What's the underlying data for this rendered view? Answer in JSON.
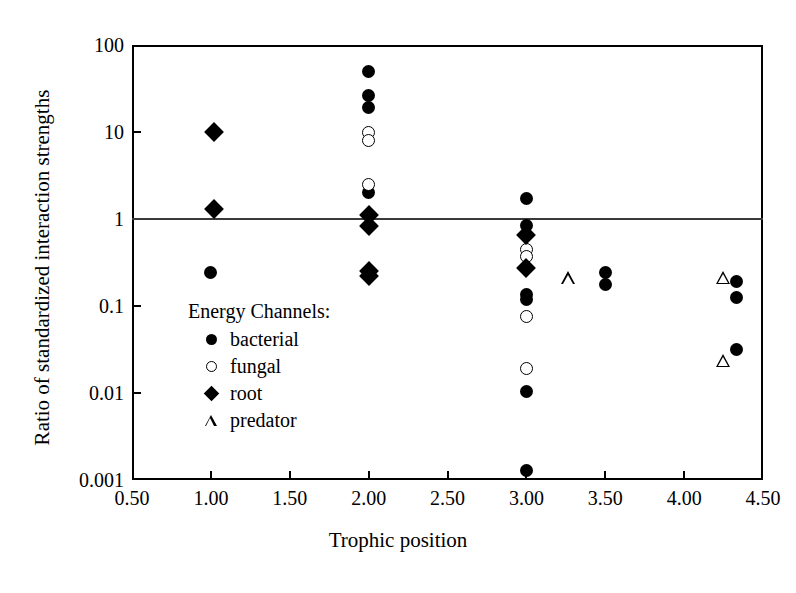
{
  "chart_data": {
    "type": "scatter",
    "title": "",
    "xlabel": "Trophic position",
    "ylabel": "Ratio of standardized interaction strengths",
    "xlim": [
      0.5,
      4.5
    ],
    "ylim": [
      0.001,
      100
    ],
    "yscale": "log",
    "xticks": [
      "0.50",
      "1.00",
      "1.50",
      "2.00",
      "2.50",
      "3.00",
      "3.50",
      "4.00",
      "4.50"
    ],
    "xtick_values": [
      0.5,
      1.0,
      1.5,
      2.0,
      2.5,
      3.0,
      3.5,
      4.0,
      4.5
    ],
    "yticks": [
      "100",
      "10",
      "1",
      "0.1",
      "0.01",
      "0.001"
    ],
    "ytick_values": [
      100,
      10,
      1,
      0.1,
      0.01,
      0.001
    ],
    "grid": false,
    "reference_line": {
      "y": 1,
      "orientation": "horizontal",
      "color": "#3a3a3a"
    },
    "legend_title": "Energy Channels:",
    "legend_position": "inside-left",
    "series": [
      {
        "name": "bacterial",
        "marker": "filled-circle",
        "color": "#000000",
        "points": [
          {
            "x": 1.0,
            "y": 0.24
          },
          {
            "x": 2.0,
            "y": 50
          },
          {
            "x": 2.0,
            "y": 26
          },
          {
            "x": 2.0,
            "y": 19
          },
          {
            "x": 2.0,
            "y": 2.0
          },
          {
            "x": 3.0,
            "y": 1.7
          },
          {
            "x": 3.0,
            "y": 0.85
          },
          {
            "x": 3.0,
            "y": 0.135
          },
          {
            "x": 3.0,
            "y": 0.12
          },
          {
            "x": 3.0,
            "y": 0.0105
          },
          {
            "x": 3.0,
            "y": 0.0013
          },
          {
            "x": 3.5,
            "y": 0.245
          },
          {
            "x": 3.5,
            "y": 0.175
          },
          {
            "x": 4.33,
            "y": 0.19
          },
          {
            "x": 4.33,
            "y": 0.125
          },
          {
            "x": 4.33,
            "y": 0.032
          }
        ]
      },
      {
        "name": "fungal",
        "marker": "open-circle",
        "color": "#000000",
        "points": [
          {
            "x": 2.0,
            "y": 10.0
          },
          {
            "x": 2.0,
            "y": 8.0
          },
          {
            "x": 2.0,
            "y": 2.5
          },
          {
            "x": 3.0,
            "y": 0.45
          },
          {
            "x": 3.0,
            "y": 0.37
          },
          {
            "x": 3.0,
            "y": 0.075
          },
          {
            "x": 3.0,
            "y": 0.019
          }
        ]
      },
      {
        "name": "root",
        "marker": "filled-diamond",
        "color": "#000000",
        "points": [
          {
            "x": 1.02,
            "y": 10.0
          },
          {
            "x": 1.02,
            "y": 1.3
          },
          {
            "x": 2.0,
            "y": 1.1
          },
          {
            "x": 2.0,
            "y": 0.82
          },
          {
            "x": 2.0,
            "y": 0.25
          },
          {
            "x": 2.0,
            "y": 0.22
          },
          {
            "x": 3.0,
            "y": 0.65
          },
          {
            "x": 3.0,
            "y": 0.27
          }
        ]
      },
      {
        "name": "predator",
        "marker": "open-triangle",
        "color": "#000000",
        "points": [
          {
            "x": 3.27,
            "y": 0.21
          },
          {
            "x": 4.25,
            "y": 0.3
          },
          {
            "x": 4.25,
            "y": 0.047
          }
        ]
      }
    ]
  },
  "axes": {
    "x_title": "Trophic position",
    "y_title": "Ratio of standardized interaction strengths"
  },
  "legend": {
    "title": "Energy Channels:",
    "items": [
      {
        "label": "bacterial",
        "symbol": "filled-circle-icon"
      },
      {
        "label": "fungal",
        "symbol": "open-circle-icon"
      },
      {
        "label": "root",
        "symbol": "filled-diamond-icon"
      },
      {
        "label": "predator",
        "symbol": "open-triangle-icon"
      }
    ]
  }
}
